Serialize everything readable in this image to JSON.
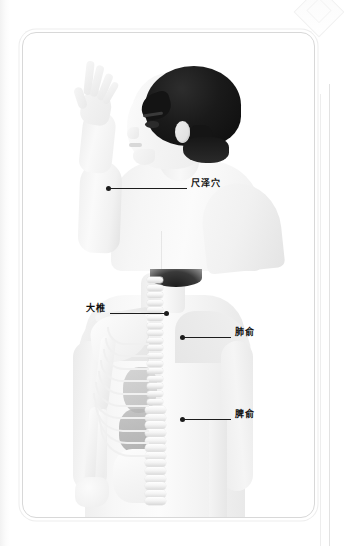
{
  "figure": {
    "panels": [
      {
        "id": "upper",
        "name": "boy-profile-front-view",
        "annotations": [
          {
            "label": "尺泽穴",
            "pinyin_name": "chize-point",
            "dot": {
              "x": 105,
              "y": 187
            },
            "label_x": 188,
            "leader_length": 78,
            "direction": "right"
          }
        ]
      },
      {
        "id": "lower",
        "name": "back-skeleton-view",
        "annotations": [
          {
            "label": "大椎",
            "pinyin_name": "dazhui-point",
            "dot": {
              "x": 168,
              "y": 312
            },
            "label_x": 67,
            "leader_length": 56,
            "direction": "left"
          },
          {
            "label": "肺俞",
            "pinyin_name": "feishu-point",
            "dot": {
              "x": 179,
              "y": 336
            },
            "label_x": 231,
            "leader_length": 48,
            "direction": "right"
          },
          {
            "label": "脾俞",
            "pinyin_name": "pishu-point",
            "dot": {
              "x": 179,
              "y": 418
            },
            "label_x": 231,
            "leader_length": 48,
            "direction": "right"
          }
        ]
      }
    ],
    "colors": {
      "leader_line": "#1c1c1c",
      "label_text": "#101010",
      "frame_border": "#d8d8d8",
      "hair": "#141414",
      "skin_light": "#f6f6f6",
      "bone": "#fbfbfb",
      "organ": "#b0b0b0",
      "page_background": "#ffffff"
    }
  }
}
